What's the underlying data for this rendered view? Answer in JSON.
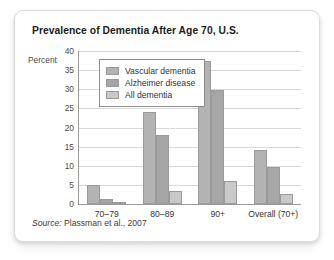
{
  "card": {
    "title": "Prevalence of Dementia After Age 70, U.S.",
    "source_prefix": "Source:",
    "source_text": "Plassman et al., 2007"
  },
  "chart_data": {
    "type": "bar",
    "title": "Prevalence of Dementia After Age 70, U.S.",
    "xlabel": "",
    "ylabel": "Percent",
    "ylim": [
      0,
      40
    ],
    "yticks": [
      0,
      5,
      10,
      15,
      20,
      25,
      30,
      35,
      40
    ],
    "grid": true,
    "legend_position": "top-left-inside",
    "categories": [
      "70–79",
      "80–89",
      "90+",
      "Overall (70+)"
    ],
    "series": [
      {
        "name": "Vascular dementia",
        "color": "#b3b3b3",
        "values": [
          5,
          24,
          37.4,
          14
        ]
      },
      {
        "name": "Alzheimer disease",
        "color": "#a6a6a6",
        "values": [
          1.2,
          18,
          29.7,
          9.8
        ]
      },
      {
        "name": "All dementia",
        "color": "#c9c9c9",
        "values": [
          0.3,
          3.5,
          6,
          2.5
        ]
      }
    ]
  }
}
